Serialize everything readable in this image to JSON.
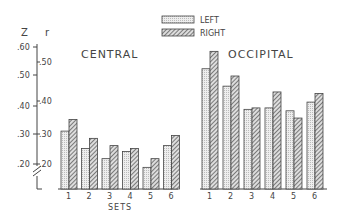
{
  "legend": {
    "left_label": "LEFT",
    "right_label": "RIGHT"
  },
  "axes": {
    "z_label": "Z",
    "r_label": "r",
    "z_ticks": [
      ".60",
      ".50",
      ".40",
      ".30",
      ".20"
    ],
    "r_ticks": [
      ".50",
      ".40",
      ".30",
      ".20"
    ],
    "xlabel": "SETS"
  },
  "panels": {
    "central_title": "CENTRAL",
    "occipital_title": "OCCIPITAL"
  },
  "chart_data": {
    "type": "bar",
    "title": "",
    "xlabel": "SETS",
    "ylabel": "Z / r",
    "ylim": [
      0.115,
      0.62
    ],
    "y_axis_break": true,
    "legend_position": "top-center",
    "grid": false,
    "panels": [
      {
        "name": "CENTRAL",
        "categories": [
          "1",
          "2",
          "3",
          "4",
          "5",
          "6"
        ],
        "series": [
          {
            "name": "LEFT",
            "values": [
              0.31,
              0.25,
              0.215,
              0.24,
              0.185,
              0.26
            ]
          },
          {
            "name": "RIGHT",
            "values": [
              0.35,
              0.285,
              0.26,
              0.25,
              0.215,
              0.295
            ]
          }
        ]
      },
      {
        "name": "OCCIPITAL",
        "categories": [
          "1",
          "2",
          "3",
          "4",
          "5",
          "6"
        ],
        "series": [
          {
            "name": "LEFT",
            "values": [
              0.525,
              0.465,
              0.385,
              0.39,
              0.38,
              0.41
            ]
          },
          {
            "name": "RIGHT",
            "values": [
              0.585,
              0.5,
              0.39,
              0.445,
              0.355,
              0.44
            ]
          }
        ]
      }
    ],
    "z_ticks": [
      0.6,
      0.5,
      0.4,
      0.3,
      0.2
    ],
    "r_ticks": [
      0.5,
      0.4,
      0.3,
      0.2
    ]
  }
}
